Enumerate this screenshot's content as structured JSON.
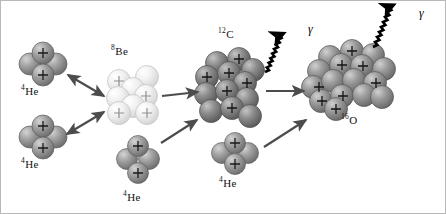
{
  "figure": {
    "background": "#ffffff",
    "border_color": "#b8b8b8",
    "width": 446,
    "height": 214
  },
  "palette": {
    "helium_sphere": "#9a9a9a",
    "helium_sphere_dark": "#6f6f6f",
    "beryllium_sphere": "#ededed",
    "beryllium_sphere_dark": "#cfcfcf",
    "carbon_sphere": "#8a8a8a",
    "carbon_sphere_dark": "#5e5e5e",
    "oxygen_sphere": "#9a9a9a",
    "oxygen_sphere_dark": "#6b6b6b",
    "arrow_gray": "#4c4c4c",
    "gamma_black": "#000000",
    "plus_sign": "#1a1a1a",
    "text": "#111111"
  },
  "nuclei": [
    {
      "id": "he4-top-left",
      "label_mass": "4",
      "label_symbol": "He",
      "nucleon_count": 4,
      "charge_marks": 2,
      "label_x": 20,
      "label_y": 84,
      "cluster_cx": 42,
      "cluster_cy": 63,
      "shade": "helium"
    },
    {
      "id": "be8",
      "label_mass": "8",
      "label_symbol": "Be",
      "nucleon_count": 8,
      "charge_marks": 4,
      "label_x": 110,
      "label_y": 44,
      "cluster_cx": 130,
      "cluster_cy": 92,
      "shade": "beryllium"
    },
    {
      "id": "he4-bottom-left",
      "label_mass": "4",
      "label_symbol": "He",
      "nucleon_count": 4,
      "charge_marks": 2,
      "label_x": 20,
      "label_y": 157,
      "cluster_cx": 42,
      "cluster_cy": 136,
      "shade": "helium"
    },
    {
      "id": "he4-bottom-middle",
      "label_mass": "4",
      "label_symbol": "He",
      "nucleon_count": 4,
      "charge_marks": 2,
      "label_x": 122,
      "label_y": 190,
      "cluster_cx": 137,
      "cluster_cy": 160,
      "shade": "helium"
    },
    {
      "id": "c12",
      "label_mass": "12",
      "label_symbol": "C",
      "nucleon_count": 12,
      "charge_marks": 6,
      "label_x": 217,
      "label_y": 27,
      "cluster_cx": 228,
      "cluster_cy": 88,
      "shade": "carbon"
    },
    {
      "id": "he4-bottom-right",
      "label_mass": "4",
      "label_symbol": "He",
      "nucleon_count": 4,
      "charge_marks": 2,
      "label_x": 218,
      "label_y": 176,
      "cluster_cx": 234,
      "cluster_cy": 152,
      "shade": "helium"
    },
    {
      "id": "o16",
      "label_mass": "16",
      "label_symbol": "O",
      "nucleon_count": 16,
      "charge_marks": 8,
      "label_x": 340,
      "label_y": 113,
      "cluster_cx": 348,
      "cluster_cy": 82,
      "shade": "oxygen"
    }
  ],
  "photons": [
    {
      "id": "gamma-from-c12",
      "symbol": "γ",
      "label_x": 307,
      "label_y": 21
    },
    {
      "id": "gamma-from-o16",
      "symbol": "γ",
      "label_x": 418,
      "label_y": 5
    }
  ],
  "reactions": [
    {
      "id": "he4-to-be8-upper",
      "kind": "double-arrow",
      "from": "he4-top-left",
      "to": "be8"
    },
    {
      "id": "he4-to-be8-lower",
      "kind": "double-arrow",
      "from": "he4-bottom-left",
      "to": "be8"
    },
    {
      "id": "be8-to-c12",
      "kind": "single-arrow",
      "from": "be8",
      "to": "c12"
    },
    {
      "id": "he4-to-c12",
      "kind": "single-arrow",
      "from": "he4-bottom-middle",
      "to": "c12"
    },
    {
      "id": "c12-to-o16",
      "kind": "single-arrow",
      "from": "c12",
      "to": "o16"
    },
    {
      "id": "he4-to-o16",
      "kind": "single-arrow",
      "from": "he4-bottom-right",
      "to": "o16"
    },
    {
      "id": "c12-emits-gamma",
      "kind": "wavy-arrow",
      "from": "c12",
      "to": "gamma-from-c12"
    },
    {
      "id": "o16-emits-gamma",
      "kind": "wavy-arrow",
      "from": "o16",
      "to": "gamma-from-o16"
    }
  ]
}
